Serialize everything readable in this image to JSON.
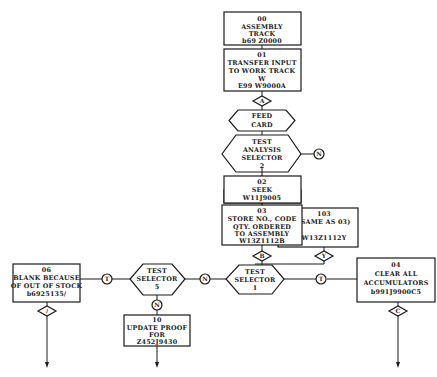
{
  "diagram": {
    "type": "flowchart",
    "nodes": {
      "n00": {
        "lines": [
          "00",
          "ASSEMBLY",
          "TRACK",
          "b69 Z0000"
        ]
      },
      "n01": {
        "lines": [
          "01",
          "TRANSFER INPUT",
          "TO WORK TRACK",
          "W",
          "E99 W9000A"
        ]
      },
      "connA": {
        "label": "A"
      },
      "feed": {
        "lines": [
          "FEED",
          "CARD"
        ]
      },
      "tas": {
        "lines": [
          "TEST",
          "ANALYSIS",
          "SELECTOR",
          "2"
        ]
      },
      "tas_n": {
        "label": "N"
      },
      "tas_t": {
        "label": "T"
      },
      "n02": {
        "lines": [
          "02",
          "SEEK",
          "W11J9005"
        ]
      },
      "n03": {
        "lines": [
          "03",
          "STORE NO., CODE",
          "QTY. ORDERED",
          "TO ASSEMBLY",
          "W13Z1112B"
        ]
      },
      "n103": {
        "lines": [
          "103",
          "(SAME AS 03)",
          "",
          "W13Z1112Y"
        ]
      },
      "connB": {
        "label": "B"
      },
      "connY": {
        "label": "Y"
      },
      "ts1": {
        "lines": [
          "TEST",
          "SELECTOR",
          "1"
        ]
      },
      "ts1_t": {
        "label": "T"
      },
      "ts1_n": {
        "label": "N"
      },
      "n04": {
        "lines": [
          "04",
          "CLEAR ALL",
          "ACCUMULATORS",
          "b991J9900C5"
        ]
      },
      "connC": {
        "label": "C"
      },
      "ts5": {
        "lines": [
          "TEST",
          "SELECTOR",
          "5"
        ]
      },
      "ts5_t": {
        "label": "T"
      },
      "ts5_n": {
        "label": "N"
      },
      "n06": {
        "lines": [
          "06",
          "BLANK BECAUSE",
          "OF OUT OF STOCK",
          "b6925135/"
        ]
      },
      "connSlash": {
        "label": "/"
      },
      "n10": {
        "lines": [
          "10",
          "UPDATE PROOF",
          "FOR",
          "Z452J9430"
        ]
      }
    }
  }
}
